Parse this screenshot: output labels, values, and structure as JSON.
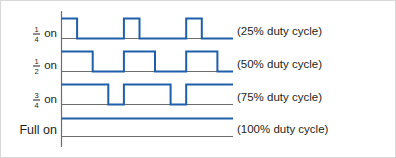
{
  "figure": {
    "axis_color": "#6d6d6d",
    "wave_color": "#1f5fa9",
    "text_color": "#231f20",
    "background": "#ffffff"
  },
  "chart_data": {
    "type": "line",
    "title": "",
    "xlabel": "",
    "ylabel": "",
    "grid": false,
    "legend_position": "right",
    "x": [
      0,
      0.25,
      0.5,
      0.75,
      1.0,
      1.25,
      1.5,
      1.75,
      2.0,
      2.25,
      2.5
    ],
    "xlim": [
      0,
      2.5
    ],
    "ylim": [
      0,
      1
    ],
    "series": [
      {
        "name": "1/4 on",
        "duty_cycle_percent": 25,
        "row_label": "on",
        "fraction_numerator": "1",
        "fraction_denominator": "4",
        "duty_label": "(25% duty cycle)",
        "levels": [
          1,
          0,
          0,
          0,
          1,
          0,
          0,
          0,
          1,
          0,
          0
        ]
      },
      {
        "name": "1/2 on",
        "duty_cycle_percent": 50,
        "row_label": "on",
        "fraction_numerator": "1",
        "fraction_denominator": "2",
        "duty_label": "(50% duty cycle)",
        "levels": [
          1,
          1,
          0,
          0,
          1,
          1,
          0,
          0,
          1,
          1,
          0
        ]
      },
      {
        "name": "3/4 on",
        "duty_cycle_percent": 75,
        "row_label": "on",
        "fraction_numerator": "3",
        "fraction_denominator": "4",
        "duty_label": "(75% duty cycle)",
        "levels": [
          1,
          1,
          1,
          0,
          1,
          1,
          1,
          0,
          1,
          1,
          1
        ]
      },
      {
        "name": "Full on",
        "duty_cycle_percent": 100,
        "row_label": "Full on",
        "fraction_numerator": "",
        "fraction_denominator": "",
        "duty_label": "(100% duty cycle)",
        "levels": [
          1,
          1,
          1,
          1,
          1,
          1,
          1,
          1,
          1,
          1,
          1
        ]
      }
    ]
  }
}
